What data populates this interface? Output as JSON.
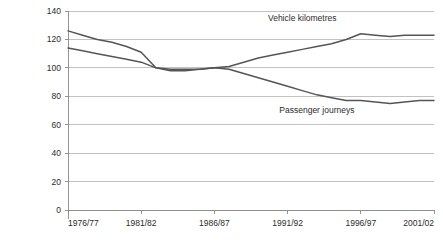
{
  "chart_data": {
    "type": "line",
    "title": "",
    "subtitle": "",
    "xlabel": "",
    "ylabel": "",
    "xlim": [
      1976,
      2001
    ],
    "ylim": [
      0,
      140
    ],
    "ytick_step": 20,
    "grid": true,
    "legend_position": "inline-annotation",
    "yticks": [
      "0",
      "20",
      "40",
      "60",
      "80",
      "100",
      "120",
      "140"
    ],
    "ytick_values": [
      0,
      20,
      40,
      60,
      80,
      100,
      120,
      140
    ],
    "xticks": [
      "1976/77",
      "1981/82",
      "1986/87",
      "1991/92",
      "1996/97",
      "2001/02"
    ],
    "xtick_values": [
      1976,
      1981,
      1986,
      1991,
      1996,
      2001
    ],
    "x": [
      1976,
      1977,
      1978,
      1979,
      1980,
      1981,
      1982,
      1983,
      1984,
      1985,
      1986,
      1987,
      1988,
      1989,
      1990,
      1991,
      1992,
      1993,
      1994,
      1995,
      1996,
      1997,
      1998,
      1999,
      2000,
      2001
    ],
    "series": [
      {
        "name": "Vehicle kilometres",
        "color": "#555555",
        "label_x": 1992,
        "label_y": 133,
        "values": [
          126,
          123,
          120,
          118,
          115,
          111,
          100,
          99,
          99,
          99,
          100,
          101,
          104,
          107,
          109,
          111,
          113,
          115,
          117,
          120,
          124,
          123,
          122,
          123,
          123,
          123
        ]
      },
      {
        "name": "Passenger journeys",
        "color": "#555555",
        "label_x": 1993,
        "label_y": 68,
        "values": [
          114,
          112,
          110,
          108,
          106,
          104,
          100,
          98,
          98,
          99,
          100,
          99,
          96,
          93,
          90,
          87,
          84,
          81,
          79,
          77,
          77,
          76,
          75,
          76,
          77,
          77
        ]
      }
    ]
  },
  "axis": {
    "y_ticks": [
      {
        "label": "140",
        "value": 140
      },
      {
        "label": "120",
        "value": 120
      },
      {
        "label": "100",
        "value": 100
      },
      {
        "label": "80",
        "value": 80
      },
      {
        "label": "60",
        "value": 60
      },
      {
        "label": "40",
        "value": 40
      },
      {
        "label": "20",
        "value": 20
      },
      {
        "label": "0",
        "value": 0
      }
    ],
    "x_ticks": [
      {
        "label": "1976/77",
        "value": 1976
      },
      {
        "label": "1981/82",
        "value": 1981
      },
      {
        "label": "1986/87",
        "value": 1986
      },
      {
        "label": "1991/92",
        "value": 1991
      },
      {
        "label": "1996/97",
        "value": 1996
      },
      {
        "label": "2001/02",
        "value": 2001
      }
    ]
  },
  "annotations": [
    {
      "name": "vehicle-kilometres-label",
      "text": "Vehicle kilometres"
    },
    {
      "name": "passenger-journeys-label",
      "text": "Passenger journeys"
    }
  ]
}
